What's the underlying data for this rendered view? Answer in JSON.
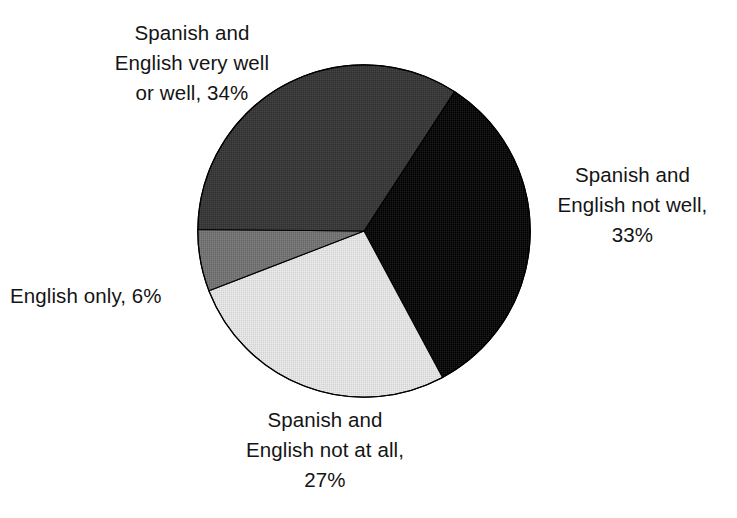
{
  "chart_data": {
    "type": "pie",
    "title": "",
    "subtitle": "",
    "xlabel": "",
    "ylabel": "",
    "legend_position": "none",
    "grid": false,
    "labels_outside": true,
    "center": {
      "x": 364,
      "y": 231,
      "radius": 167
    },
    "start_angle_deg_from_north": 33,
    "direction": "clockwise",
    "categories": [
      "Spanish and English not well",
      "Spanish and English not at all",
      "English only",
      "Spanish and English very well or well"
    ],
    "values": [
      33,
      27,
      6,
      34
    ],
    "value_unit": "%",
    "slices": [
      {
        "name": "spanish-english-not-well",
        "category": "Spanish and English not well",
        "value": 33,
        "label_text": "Spanish and\nEnglish not well,\n33%",
        "color": "#0d0d0d",
        "start_deg": 33,
        "end_deg": 151.8
      },
      {
        "name": "spanish-english-not-at-all",
        "category": "Spanish and English not at all",
        "value": 27,
        "label_text": "Spanish and\nEnglish not at all,\n27%",
        "color": "#dcdcdc",
        "start_deg": 151.8,
        "end_deg": 248.9
      },
      {
        "name": "english-only",
        "category": "English only",
        "value": 6,
        "label_text": "English only, 6%",
        "color": "#737373",
        "start_deg": 248.9,
        "end_deg": 270.5
      },
      {
        "name": "spanish-english-very-well-or-well",
        "category": "Spanish and English very well or well",
        "value": 34,
        "label_text": "Spanish and\nEnglish very well\nor well, 34%",
        "color": "#3a3a3a",
        "start_deg": 270.5,
        "end_deg": 393
      }
    ],
    "colors": {
      "black": "#0d0d0d",
      "dark_gray": "#3a3a3a",
      "medium_gray": "#737373",
      "light_gray": "#dcdcdc",
      "outline": "#000000",
      "background": "#ffffff",
      "text": "#141414"
    }
  },
  "labels": {
    "very_well_or_well": "Spanish and\nEnglish very well\nor well, 34%",
    "not_well": "Spanish and\nEnglish not well,\n33%",
    "english_only": "English only, 6%",
    "not_at_all": "Spanish and\nEnglish not at all,\n27%"
  }
}
